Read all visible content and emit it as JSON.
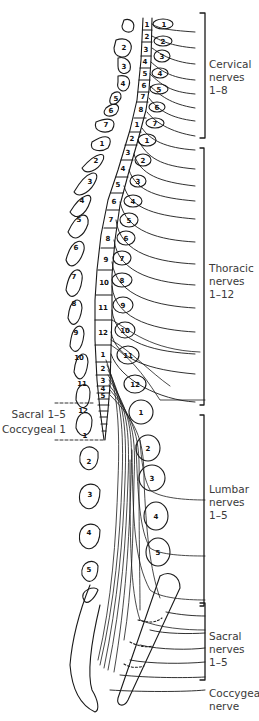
{
  "diagram": {
    "regions": [
      {
        "id": "cervical",
        "label": "Cervical\nnerves\n1–8",
        "range": "1-8"
      },
      {
        "id": "thoracic",
        "label": "Thoracic\nnerves\n1–12",
        "range": "1-12"
      },
      {
        "id": "lumbar",
        "label": "Lumbar\nnerves\n1–5",
        "range": "1-5"
      },
      {
        "id": "sacral",
        "label": "Sacral\nnerves\n1–5",
        "range": "1-5"
      },
      {
        "id": "coccygeal",
        "label": "Coccygeal\nnerve",
        "range": "1"
      }
    ],
    "left_labels": {
      "sacral": "Sacral 1–5",
      "coccygeal": "Coccygeal 1"
    },
    "cord_segments": {
      "cervical": [
        "1",
        "2",
        "3",
        "4",
        "5",
        "6",
        "7",
        "8"
      ],
      "thoracic": [
        "1",
        "2",
        "3",
        "4",
        "5",
        "6",
        "7",
        "8",
        "9",
        "10",
        "11",
        "12"
      ],
      "lumbar": [
        "1",
        "2",
        "3",
        "4",
        "5"
      ]
    },
    "left_vertebrae": {
      "cervical": [
        "1",
        "2",
        "3",
        "4",
        "5",
        "6",
        "7"
      ],
      "thoracic": [
        "1",
        "2",
        "3",
        "4",
        "5",
        "6",
        "7",
        "8",
        "9",
        "10",
        "11",
        "12"
      ],
      "lumbar": [
        "1",
        "2",
        "3",
        "4",
        "5"
      ]
    },
    "right_foramina": {
      "cervical": [
        "1",
        "2",
        "3",
        "4",
        "5",
        "6",
        "7"
      ],
      "thoracic": [
        "1",
        "2",
        "3",
        "4",
        "5",
        "6",
        "7",
        "8",
        "9",
        "10",
        "11",
        "12"
      ],
      "lumbar": [
        "1",
        "2",
        "3",
        "4",
        "5"
      ]
    },
    "colors": {
      "line": "#1a1a1a",
      "text": "#3a3a3a",
      "background": "#ffffff"
    }
  }
}
